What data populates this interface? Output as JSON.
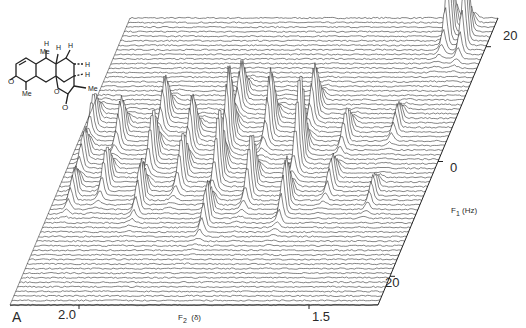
{
  "figure": {
    "panel_label": "A",
    "molecule_labels": {
      "me1": "Me",
      "me2": "Me",
      "me3": "Me",
      "o1": "O",
      "o2": "O",
      "o3": "O",
      "h": "H"
    }
  },
  "chart_data": {
    "type": "stacked-line",
    "xlabel": "F2 (δ)",
    "xlabel_main": "F",
    "xlabel_sub": "2",
    "xlabel_unit": "(δ)",
    "ylabel": "F1 (Hz)",
    "ylabel_main": "F",
    "ylabel_sub": "1",
    "ylabel_unit": "(Hz)",
    "x_ticks": [
      {
        "value": 2.0,
        "label": "2.0"
      },
      {
        "value": 1.5,
        "label": "1.5"
      }
    ],
    "y_ticks": [
      {
        "value": -20,
        "label": "-20"
      },
      {
        "value": 0,
        "label": "0"
      },
      {
        "value": 20,
        "label": "20"
      }
    ],
    "xlim": [
      2.15,
      1.35
    ],
    "ylim": [
      -25,
      25
    ],
    "traces": 64,
    "peaks": [
      {
        "f2": 2.13,
        "f1": -6,
        "h": 34
      },
      {
        "f2": 2.12,
        "f1": 0,
        "h": 30
      },
      {
        "f2": 2.11,
        "f1": 6,
        "h": 26
      },
      {
        "f2": 2.06,
        "f1": -4,
        "h": 40
      },
      {
        "f2": 2.05,
        "f1": 4,
        "h": 38
      },
      {
        "f2": 1.98,
        "f1": -7,
        "h": 44
      },
      {
        "f2": 1.97,
        "f1": 0,
        "h": 52
      },
      {
        "f2": 1.96,
        "f1": 7,
        "h": 40
      },
      {
        "f2": 1.9,
        "f1": -3,
        "h": 48
      },
      {
        "f2": 1.89,
        "f1": 3,
        "h": 46
      },
      {
        "f2": 1.83,
        "f1": -10,
        "h": 40
      },
      {
        "f2": 1.82,
        "f1": -3,
        "h": 76
      },
      {
        "f2": 1.81,
        "f1": 3,
        "h": 70
      },
      {
        "f2": 1.8,
        "f1": 10,
        "h": 36
      },
      {
        "f2": 1.74,
        "f1": -5,
        "h": 62
      },
      {
        "f2": 1.73,
        "f1": 5,
        "h": 58
      },
      {
        "f2": 1.66,
        "f1": -8,
        "h": 50
      },
      {
        "f2": 1.65,
        "f1": 0,
        "h": 90
      },
      {
        "f2": 1.64,
        "f1": 8,
        "h": 48
      },
      {
        "f2": 1.57,
        "f1": -4,
        "h": 30
      },
      {
        "f2": 1.56,
        "f1": 4,
        "h": 28
      },
      {
        "f2": 1.47,
        "f1": -6,
        "h": 22
      },
      {
        "f2": 1.46,
        "f1": 6,
        "h": 20
      },
      {
        "f2": 1.44,
        "f1": -22,
        "h": 66
      },
      {
        "f2": 1.4,
        "f1": -21,
        "h": 60
      }
    ]
  }
}
